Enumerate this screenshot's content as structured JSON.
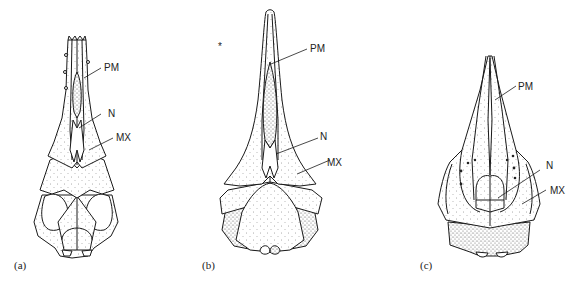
{
  "figure": {
    "panels": [
      {
        "id": "a",
        "panel_label": "(a)",
        "labels": {
          "pm": "PM",
          "n": "N",
          "mx": "MX"
        }
      },
      {
        "id": "b",
        "panel_label": "(b)",
        "labels": {
          "pm": "PM",
          "n": "N",
          "mx": "MX"
        }
      },
      {
        "id": "c",
        "panel_label": "(c)",
        "labels": {
          "pm": "PM",
          "n": "N",
          "mx": "MX"
        }
      }
    ],
    "stray_mark": "*"
  }
}
